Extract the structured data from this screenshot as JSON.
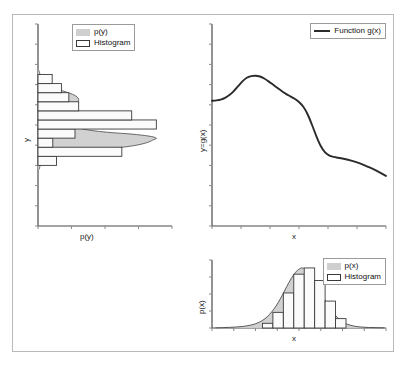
{
  "figure": {
    "background": "#ffffff",
    "frame_color": "#b9b9b9",
    "density_fill_color": "#cfcfcf",
    "histogram_edge_color": "#3a3a3a",
    "curve_color": "#2b2b2b"
  },
  "panels": {
    "left": {
      "name": "p(y) marginal panel",
      "xlabel": "p(y)",
      "ylabel": "y",
      "legend": [
        {
          "label": "p(y)",
          "marker": "filled-swatch"
        },
        {
          "label": "Histogram",
          "marker": "open-swatch"
        }
      ]
    },
    "topright": {
      "name": "function panel",
      "xlabel": "x",
      "ylabel": "y=g(x)",
      "legend": [
        {
          "label": "Function g(x)",
          "marker": "line"
        }
      ]
    },
    "bottomright": {
      "name": "p(x) marginal panel",
      "xlabel": "x",
      "ylabel": "p(x)",
      "legend": [
        {
          "label": "p(x)",
          "marker": "filled-swatch"
        },
        {
          "label": "Histogram",
          "marker": "open-swatch"
        }
      ]
    }
  },
  "chart_data": [
    {
      "type": "bar",
      "id": "left-histogram-py",
      "orientation": "horizontal",
      "title": "",
      "xlabel": "p(y)",
      "ylabel": "y",
      "xlim": [
        0,
        1
      ],
      "ylim": [
        0,
        1
      ],
      "grid": false,
      "legend_position": "top-center",
      "bin_edges": [
        0.3,
        0.345,
        0.39,
        0.435,
        0.48,
        0.525,
        0.57,
        0.615,
        0.66,
        0.705,
        0.75
      ],
      "values": [
        0.15,
        0.68,
        0.12,
        0.3,
        0.96,
        0.76,
        0.33,
        0.25,
        0.19,
        0.115
      ],
      "density_curve": {
        "name": "p(y)",
        "y": [
          0.28,
          0.3,
          0.32,
          0.335,
          0.348,
          0.36,
          0.372,
          0.385,
          0.398,
          0.412,
          0.425,
          0.435,
          0.445,
          0.455,
          0.462,
          0.47,
          0.478,
          0.486,
          0.494,
          0.502,
          0.51,
          0.52,
          0.53,
          0.54,
          0.55,
          0.562,
          0.574,
          0.586,
          0.598,
          0.61,
          0.622,
          0.634,
          0.646,
          0.658,
          0.67,
          0.684,
          0.7,
          0.72,
          0.745,
          0.77
        ],
        "p": [
          0.01,
          0.018,
          0.035,
          0.07,
          0.14,
          0.26,
          0.43,
          0.62,
          0.78,
          0.88,
          0.93,
          0.96,
          0.9,
          0.76,
          0.6,
          0.47,
          0.38,
          0.33,
          0.3,
          0.285,
          0.275,
          0.268,
          0.262,
          0.258,
          0.256,
          0.258,
          0.268,
          0.285,
          0.305,
          0.32,
          0.33,
          0.325,
          0.3,
          0.255,
          0.195,
          0.135,
          0.085,
          0.045,
          0.02,
          0.008
        ]
      }
    },
    {
      "type": "line",
      "id": "topright-function-gx",
      "title": "",
      "xlabel": "x",
      "ylabel": "y=g(x)",
      "xlim": [
        0,
        1
      ],
      "ylim": [
        0,
        1
      ],
      "grid": false,
      "legend_position": "top-right",
      "series": [
        {
          "name": "Function g(x)",
          "x": [
            0.0,
            0.025,
            0.05,
            0.075,
            0.1,
            0.125,
            0.15,
            0.175,
            0.2,
            0.225,
            0.25,
            0.275,
            0.3,
            0.325,
            0.35,
            0.375,
            0.4,
            0.425,
            0.45,
            0.475,
            0.5,
            0.525,
            0.55,
            0.575,
            0.6,
            0.625,
            0.65,
            0.675,
            0.7,
            0.725,
            0.75,
            0.8,
            0.85,
            0.9,
            0.95,
            1.0
          ],
          "y": [
            0.62,
            0.622,
            0.626,
            0.634,
            0.648,
            0.668,
            0.692,
            0.716,
            0.734,
            0.742,
            0.744,
            0.74,
            0.73,
            0.716,
            0.7,
            0.684,
            0.668,
            0.654,
            0.642,
            0.63,
            0.614,
            0.59,
            0.552,
            0.5,
            0.444,
            0.396,
            0.364,
            0.348,
            0.342,
            0.338,
            0.334,
            0.324,
            0.31,
            0.292,
            0.272,
            0.248
          ]
        }
      ]
    },
    {
      "type": "bar",
      "id": "bottomright-histogram-px",
      "orientation": "vertical",
      "title": "",
      "xlabel": "x",
      "ylabel": "p(x)",
      "xlim": [
        0,
        1
      ],
      "ylim": [
        0,
        1
      ],
      "grid": false,
      "legend_position": "top-right",
      "bin_edges": [
        0.29,
        0.35,
        0.41,
        0.47,
        0.53,
        0.59,
        0.65,
        0.71,
        0.77
      ],
      "values": [
        0.075,
        0.25,
        0.56,
        0.86,
        0.96,
        0.76,
        0.43,
        0.15
      ],
      "density_curve": {
        "name": "p(x)",
        "x": [
          0.02,
          0.06,
          0.1,
          0.14,
          0.18,
          0.22,
          0.25,
          0.28,
          0.305,
          0.33,
          0.355,
          0.38,
          0.405,
          0.43,
          0.455,
          0.48,
          0.5,
          0.52,
          0.545,
          0.57,
          0.595,
          0.62,
          0.645,
          0.67,
          0.695,
          0.72,
          0.75,
          0.78,
          0.82,
          0.86,
          0.9,
          0.95,
          0.99
        ],
        "p": [
          0.004,
          0.006,
          0.01,
          0.016,
          0.026,
          0.045,
          0.068,
          0.105,
          0.15,
          0.215,
          0.3,
          0.405,
          0.53,
          0.665,
          0.79,
          0.89,
          0.94,
          0.96,
          0.92,
          0.84,
          0.73,
          0.6,
          0.47,
          0.35,
          0.25,
          0.17,
          0.1,
          0.058,
          0.028,
          0.015,
          0.009,
          0.005,
          0.003
        ]
      }
    }
  ]
}
